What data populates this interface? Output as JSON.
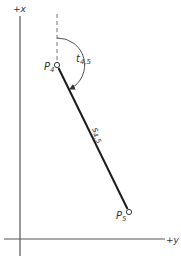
{
  "diagram": {
    "axes": {
      "x_label": "+x",
      "y_label": "+y"
    },
    "points": [
      {
        "name": "P",
        "sub": "4",
        "x": 57,
        "y": 65
      },
      {
        "name": "P",
        "sub": "5",
        "x": 129,
        "y": 212
      }
    ],
    "segment": {
      "label": "s",
      "sub": "4,5"
    },
    "angle": {
      "label": "t",
      "sub": "4,5"
    },
    "colors": {
      "line": "#1a1a1a",
      "axis": "#555555",
      "dashed": "#777777"
    }
  }
}
